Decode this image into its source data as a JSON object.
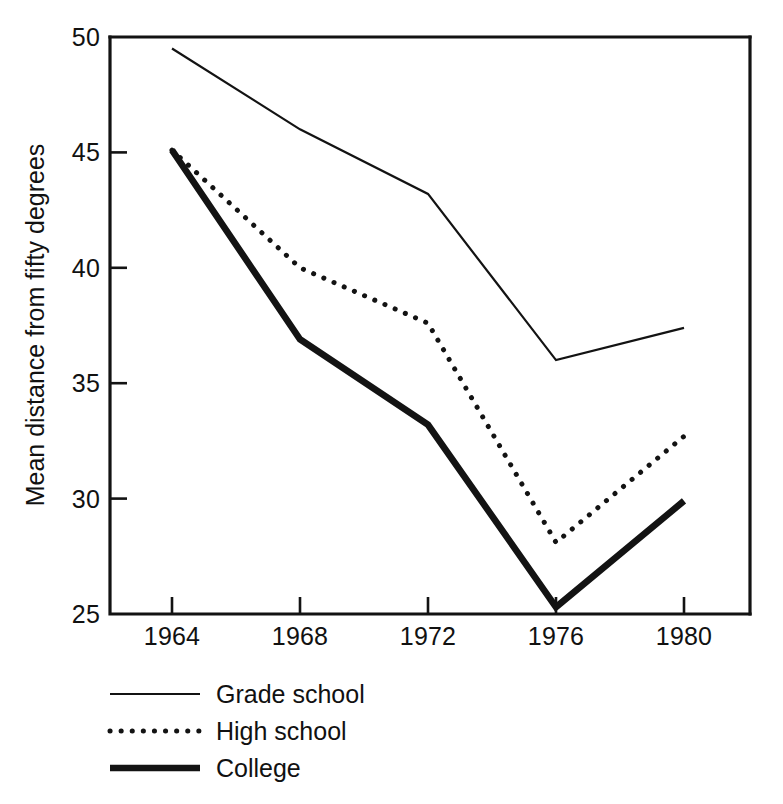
{
  "chart_data": {
    "type": "line",
    "title": "",
    "subtitle": "",
    "xlabel": "",
    "ylabel": "Mean distance from fifty degrees",
    "x": [
      1964,
      1968,
      1972,
      1976,
      1980
    ],
    "xtick_labels": [
      "1964",
      "1968",
      "1972",
      "1976",
      "1980"
    ],
    "ytick_labels": [
      "25",
      "30",
      "35",
      "40",
      "45",
      "50"
    ],
    "ytick_values": [
      25,
      30,
      35,
      40,
      45,
      50
    ],
    "xlim": [
      1962,
      1982
    ],
    "ylim": [
      25,
      50
    ],
    "grid": false,
    "legend_position": "below-left",
    "series": [
      {
        "name": "Grade school",
        "style": "thin-solid",
        "values": [
          49.5,
          46.0,
          43.2,
          36.0,
          37.4
        ]
      },
      {
        "name": "High school",
        "style": "dotted",
        "values": [
          45.1,
          40.0,
          37.6,
          28.1,
          32.7
        ]
      },
      {
        "name": "College",
        "style": "thick-solid",
        "values": [
          45.1,
          36.9,
          33.2,
          25.3,
          29.9
        ]
      }
    ]
  },
  "axis": {
    "y_label": "Mean distance from fifty degrees",
    "y_ticks": [
      "50",
      "45",
      "40",
      "35",
      "30",
      "25"
    ],
    "x_ticks": [
      "1964",
      "1968",
      "1972",
      "1976",
      "1980"
    ]
  },
  "legend": {
    "items": [
      {
        "label": "Grade school",
        "swatch": "thin-line-swatch"
      },
      {
        "label": "High school",
        "swatch": "dotted-line-swatch"
      },
      {
        "label": "College",
        "swatch": "thick-line-swatch"
      }
    ]
  },
  "colors": {
    "ink": "#131313",
    "background": "#ffffff"
  }
}
